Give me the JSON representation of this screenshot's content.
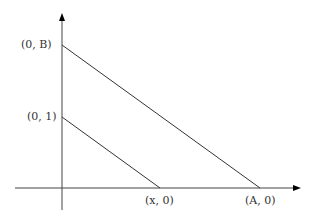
{
  "diagram": {
    "type": "coordinate-plot",
    "axes": {
      "x_axis": "horizontal with arrow",
      "y_axis": "vertical with arrow"
    },
    "lines": [
      {
        "from": "(0, B)",
        "to": "(A, 0)"
      },
      {
        "from": "(0, 1)",
        "to": "(x, 0)"
      }
    ],
    "labels": {
      "y_B": "(0, B)",
      "y_1": "(0, 1)",
      "x_x": "(x, 0)",
      "x_A": "(A, 0)"
    },
    "colors": {
      "line": "#333333",
      "axis": "#444444"
    }
  }
}
